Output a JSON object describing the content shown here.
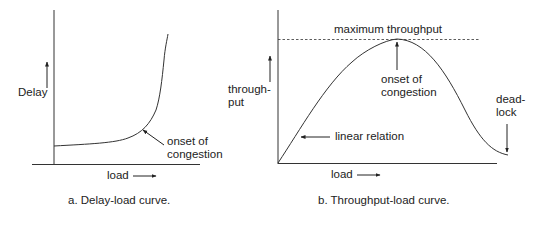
{
  "panels": [
    {
      "id": "a",
      "caption": "a. Delay-load curve.",
      "y_label": "Delay",
      "x_label": "load",
      "annotation_line1": "onset of",
      "annotation_line2": "congestion"
    },
    {
      "id": "b",
      "caption": "b. Throughput-load curve.",
      "y_label_line1": "through-",
      "y_label_line2": "put",
      "x_label": "load",
      "max_label": "maximum throughput",
      "onset_line1": "onset of",
      "onset_line2": "congestion",
      "linear_label": "linear relation",
      "deadlock_line1": "dead-",
      "deadlock_line2": "lock"
    }
  ],
  "colors": {
    "ink": "#222222",
    "background": "#ffffff"
  }
}
